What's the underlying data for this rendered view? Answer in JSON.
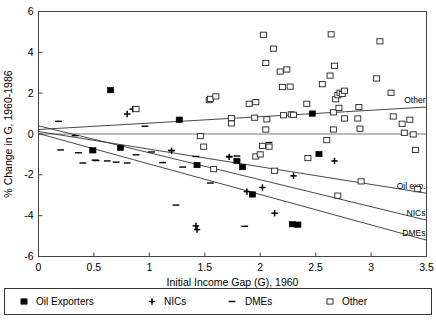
{
  "chart_data": {
    "type": "scatter",
    "title": "",
    "xlabel": "Initial Income Gap (G), 1960",
    "ylabel": "% Change in G, 1960-1986",
    "xlim": [
      0,
      3.5
    ],
    "ylim": [
      -6,
      6
    ],
    "xticks": [
      "0",
      "0.5",
      "1",
      "1.5",
      "2",
      "2.5",
      "3",
      "3.5"
    ],
    "xtick_values": [
      0,
      0.5,
      1,
      1.5,
      2,
      2.5,
      3,
      3.5
    ],
    "yticks": [
      "6",
      "4",
      "2",
      "0",
      "-2",
      "-4",
      "-6"
    ],
    "ytick_values": [
      6,
      4,
      2,
      0,
      -2,
      -4,
      -6
    ],
    "grid": false,
    "zero_line": true,
    "legend_position": "bottom",
    "series": [
      {
        "name": "Oil Exporters",
        "marker": "filled-square",
        "color": "#000000",
        "points": [
          [
            0.49,
            -0.8
          ],
          [
            0.65,
            2.15
          ],
          [
            0.74,
            -0.68
          ],
          [
            1.27,
            0.7
          ],
          [
            1.43,
            -1.52
          ],
          [
            1.79,
            -1.32
          ],
          [
            1.84,
            -1.62
          ],
          [
            1.93,
            -2.96
          ],
          [
            2.29,
            -4.42
          ],
          [
            2.34,
            -4.44
          ],
          [
            2.47,
            1.0
          ],
          [
            2.53,
            -0.98
          ]
        ]
      },
      {
        "name": "NICs",
        "marker": "plus",
        "color": "#000000",
        "points": [
          [
            0.8,
            0.98
          ],
          [
            0.85,
            1.22
          ],
          [
            1.2,
            -0.82
          ],
          [
            1.42,
            -4.5
          ],
          [
            1.43,
            -4.68
          ],
          [
            1.72,
            -1.12
          ],
          [
            1.88,
            -2.82
          ],
          [
            2.02,
            -2.62
          ],
          [
            2.13,
            -3.88
          ],
          [
            2.3,
            -2.05
          ],
          [
            2.67,
            -1.32
          ]
        ]
      },
      {
        "name": "DMEs",
        "marker": "dash",
        "color": "#000000",
        "points": [
          [
            0.18,
            0.62
          ],
          [
            0.2,
            -0.78
          ],
          [
            0.33,
            -0.08
          ],
          [
            0.36,
            -0.92
          ],
          [
            0.4,
            -1.42
          ],
          [
            0.49,
            -0.88
          ],
          [
            0.51,
            -1.28
          ],
          [
            0.52,
            -1.3
          ],
          [
            0.62,
            -1.32
          ],
          [
            0.7,
            -1.38
          ],
          [
            0.8,
            -1.42
          ],
          [
            0.88,
            -1.02
          ],
          [
            0.96,
            0.38
          ],
          [
            1.02,
            -0.88
          ],
          [
            1.12,
            -1.4
          ],
          [
            1.2,
            -0.8
          ],
          [
            1.24,
            -3.48
          ],
          [
            1.3,
            -1.62
          ],
          [
            1.42,
            -1.1
          ],
          [
            1.55,
            -2.4
          ],
          [
            1.72,
            -1.1
          ],
          [
            1.79,
            -1.08
          ],
          [
            1.86,
            -4.52
          ],
          [
            2.08,
            -0.42
          ]
        ]
      },
      {
        "name": "Other",
        "marker": "open-square",
        "color": "#000000",
        "points": [
          [
            0.88,
            1.22
          ],
          [
            1.46,
            -0.1
          ],
          [
            1.49,
            -0.62
          ],
          [
            1.54,
            1.66
          ],
          [
            1.55,
            1.72
          ],
          [
            1.6,
            1.84
          ],
          [
            1.58,
            -1.72
          ],
          [
            1.74,
            0.52
          ],
          [
            1.74,
            0.78
          ],
          [
            1.9,
            1.48
          ],
          [
            1.96,
            1.56
          ],
          [
            1.95,
            0.8
          ],
          [
            1.96,
            -1.1
          ],
          [
            2.0,
            -1.0
          ],
          [
            2.03,
            4.86
          ],
          [
            2.05,
            3.48
          ],
          [
            2.05,
            0.22
          ],
          [
            2.06,
            0.72
          ],
          [
            2.02,
            -0.58
          ],
          [
            2.08,
            -0.62
          ],
          [
            2.12,
            4.18
          ],
          [
            2.13,
            -1.8
          ],
          [
            2.18,
            3.06
          ],
          [
            2.2,
            2.3
          ],
          [
            2.21,
            0.92
          ],
          [
            2.24,
            3.16
          ],
          [
            2.27,
            2.32
          ],
          [
            2.28,
            0.96
          ],
          [
            2.3,
            0.94
          ],
          [
            2.42,
            1.48
          ],
          [
            2.43,
            -1.18
          ],
          [
            2.56,
            2.44
          ],
          [
            2.6,
            -0.3
          ],
          [
            2.63,
            2.86
          ],
          [
            2.64,
            4.88
          ],
          [
            2.66,
            1.06
          ],
          [
            2.66,
            0.22
          ],
          [
            2.67,
            3.34
          ],
          [
            2.68,
            1.7
          ],
          [
            2.7,
            1.9
          ],
          [
            2.71,
            1.28
          ],
          [
            2.72,
            2.02
          ],
          [
            2.74,
            1.96
          ],
          [
            2.76,
            2.12
          ],
          [
            2.76,
            0.76
          ],
          [
            2.7,
            -3.02
          ],
          [
            2.88,
            0.76
          ],
          [
            2.89,
            1.32
          ],
          [
            2.9,
            0.26
          ],
          [
            2.91,
            -2.32
          ],
          [
            3.05,
            2.72
          ],
          [
            3.08,
            4.54
          ],
          [
            3.18,
            2.02
          ],
          [
            3.2,
            0.86
          ],
          [
            3.28,
            0.5
          ],
          [
            3.3,
            0.06
          ],
          [
            3.35,
            0.7
          ],
          [
            3.38,
            -0.02
          ],
          [
            3.4,
            -0.78
          ],
          [
            3.42,
            -2.7
          ]
        ]
      }
    ],
    "fit_lines": [
      {
        "name": "Other",
        "label": "Other",
        "y_at_xmin": 0.22,
        "y_at_xmax": 1.32
      },
      {
        "name": "Oil exp.",
        "label": "Oil exp.",
        "y_at_xmin": 0.12,
        "y_at_xmax": -2.9
      },
      {
        "name": "NICs",
        "label": "NICs",
        "y_at_xmin": 0.4,
        "y_at_xmax": -4.22
      },
      {
        "name": "DMEs",
        "label": "DMEs",
        "y_at_xmin": 0.02,
        "y_at_xmax": -5.2
      }
    ]
  },
  "legend": {
    "items": [
      {
        "label": "Oil Exporters",
        "marker": "filled-square"
      },
      {
        "label": "NICs",
        "marker": "plus"
      },
      {
        "label": "DMEs",
        "marker": "dash"
      },
      {
        "label": "Other",
        "marker": "open-square"
      }
    ]
  }
}
